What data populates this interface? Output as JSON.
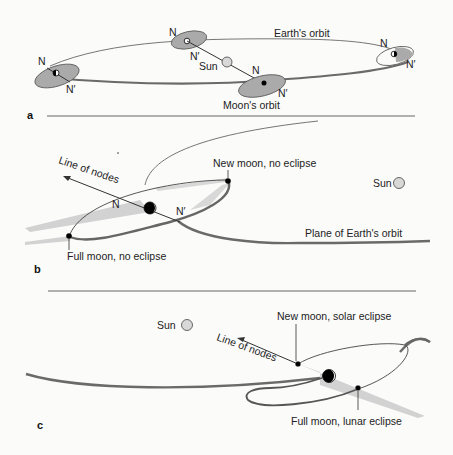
{
  "panels": {
    "a": {
      "letter": "a",
      "earth_orbit_label": "Earth's orbit",
      "moon_orbit_label": "Moon's orbit",
      "sun_label": "Sun",
      "node_label": "N",
      "node_prime_label": "N′"
    },
    "b": {
      "letter": "b",
      "line_of_nodes_label": "Line of nodes",
      "new_moon_label": "New moon, no eclipse",
      "full_moon_label": "Full moon, no eclipse",
      "sun_label": "Sun",
      "plane_label": "Plane of Earth's orbit",
      "node_label": "N",
      "node_prime_label": "N′"
    },
    "c": {
      "letter": "c",
      "sun_label": "Sun",
      "line_of_nodes_label": "Line of nodes",
      "new_moon_label": "New moon, solar eclipse",
      "full_moon_label": "Full moon, lunar eclipse"
    }
  },
  "colors": {
    "orbit_fill": "#a9a9a9",
    "shadow": "#d0d0d0",
    "sun_fill": "#d8d8d8",
    "line": "#555555",
    "bold_orbit": "#666666"
  }
}
